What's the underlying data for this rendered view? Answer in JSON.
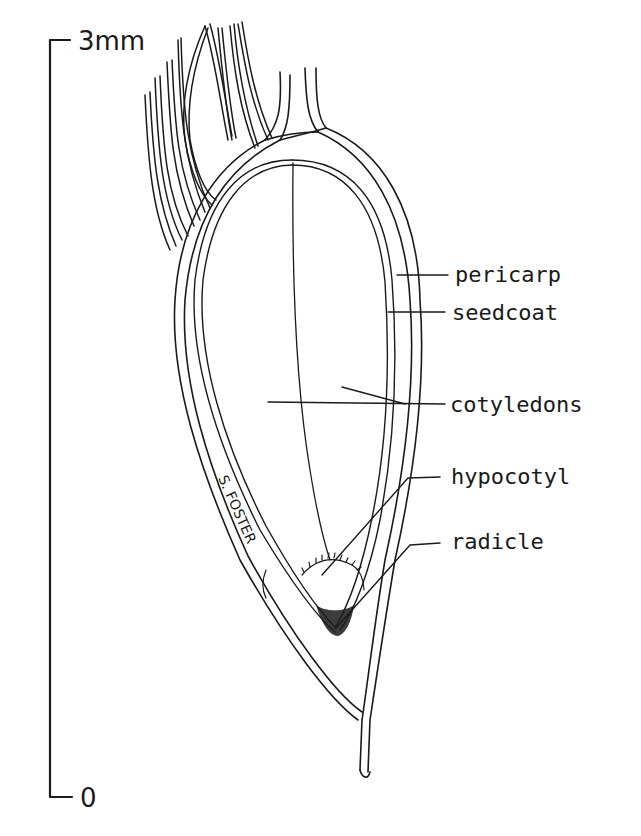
{
  "figure": {
    "ink_color": "#1a1a1a",
    "background_color": "#ffffff"
  },
  "scale_bar": {
    "top_label": "3mm",
    "bottom_label": "0",
    "length_mm": 3
  },
  "labels": [
    {
      "id": "pericarp",
      "text": "pericarp"
    },
    {
      "id": "seedcoat",
      "text": "seedcoat"
    },
    {
      "id": "cotyledons",
      "text": "cotyledons"
    },
    {
      "id": "hypocotyl",
      "text": "hypocotyl"
    },
    {
      "id": "radicle",
      "text": "radicle"
    }
  ],
  "signature": "S. FOSTER"
}
